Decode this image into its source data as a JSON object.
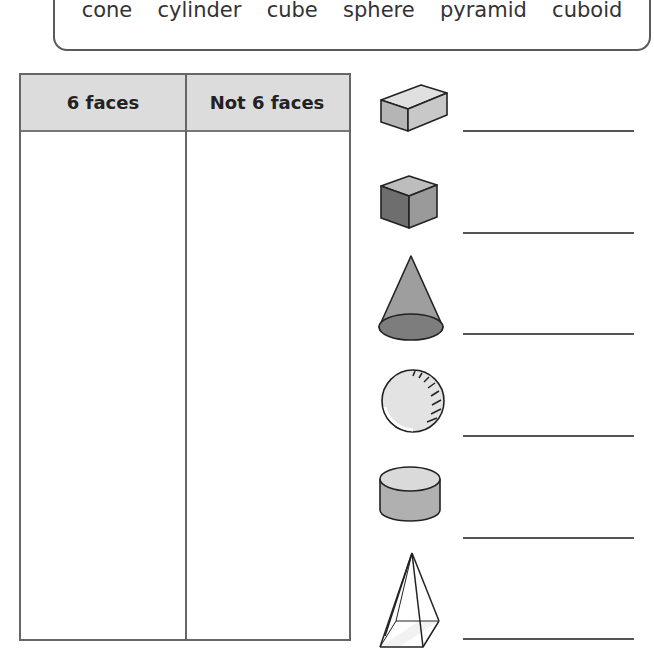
{
  "word_bank": [
    "cone",
    "cylinder",
    "cube",
    "sphere",
    "pyramid",
    "cuboid"
  ],
  "table": {
    "headers": [
      "6 faces",
      "Not 6 faces"
    ],
    "header_bg": "#dcdcdc"
  },
  "shapes": [
    {
      "icon": "cuboid-icon",
      "answer": ""
    },
    {
      "icon": "cube-icon",
      "answer": ""
    },
    {
      "icon": "cone-icon",
      "answer": ""
    },
    {
      "icon": "sphere-icon",
      "answer": ""
    },
    {
      "icon": "cylinder-icon",
      "answer": ""
    },
    {
      "icon": "pyramid-icon",
      "answer": ""
    }
  ]
}
